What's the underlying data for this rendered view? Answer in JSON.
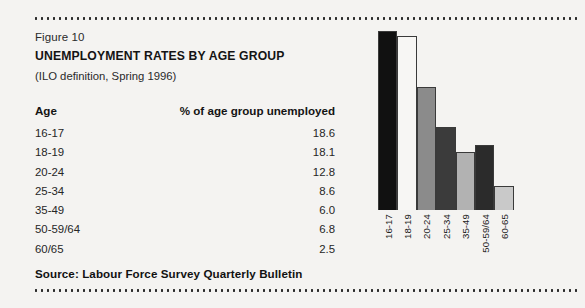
{
  "figure": {
    "label": "Figure 10",
    "title": "UNEMPLOYMENT RATES BY AGE GROUP",
    "subtitle": "(ILO definition, Spring 1996)",
    "source": "Source: Labour Force Survey Quarterly Bulletin"
  },
  "table": {
    "header_age": "Age",
    "header_pct": "% of age group unemployed",
    "rows": [
      {
        "age": "16-17",
        "pct": "18.6"
      },
      {
        "age": "18-19",
        "pct": "18.1"
      },
      {
        "age": "20-24",
        "pct": "12.8"
      },
      {
        "age": "25-34",
        "pct": "8.6"
      },
      {
        "age": "35-49",
        "pct": "6.0"
      },
      {
        "age": "50-59/64",
        "pct": "6.8"
      },
      {
        "age": "60/65",
        "pct": "2.5"
      }
    ]
  },
  "chart_data": {
    "type": "bar",
    "title": "UNEMPLOYMENT RATES BY AGE GROUP",
    "subtitle": "(ILO definition, Spring 1996)",
    "xlabel": "Age",
    "ylabel": "% of age group unemployed",
    "ylim": [
      0,
      18.6
    ],
    "grid": false,
    "legend": "none",
    "categories": [
      "16-17",
      "18-19",
      "20-24",
      "25-34",
      "35-49",
      "50-59/64",
      "60-65"
    ],
    "values": [
      18.6,
      18.1,
      12.8,
      8.6,
      6.0,
      6.8,
      2.5
    ],
    "bar_colors": [
      "#111111",
      "#f7f6f4",
      "#8b8b8b",
      "#3b3b3b",
      "#b2b2b2",
      "#2b2b2b",
      "#c9c9c9"
    ],
    "bar_border_color": "#3a3a3a"
  },
  "colors": {
    "page_background": "#f4f3f1",
    "rule": "#2b2b2b",
    "text": "#222222"
  }
}
